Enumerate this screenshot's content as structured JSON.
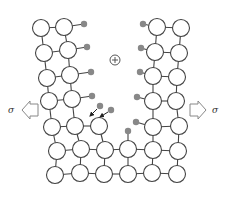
{
  "diagram": {
    "title": "",
    "labels": {
      "stress_left": "σ",
      "stress_right": "σ",
      "ion_symbol": "⊕"
    },
    "colors": {
      "atom_stroke": "#444444",
      "atom_fill": "#ffffff",
      "adatom_fill": "#888888",
      "stress_arrow_stroke": "#888888"
    },
    "atom_radius": 8.5,
    "atoms": [
      [
        41,
        28
      ],
      [
        64,
        27
      ],
      [
        44,
        53
      ],
      [
        68,
        50
      ],
      [
        47,
        78
      ],
      [
        70,
        75
      ],
      [
        49,
        101
      ],
      [
        72,
        99
      ],
      [
        52,
        127
      ],
      [
        75,
        126
      ],
      [
        99,
        126
      ],
      [
        57,
        151
      ],
      [
        81,
        149
      ],
      [
        105,
        150
      ],
      [
        128,
        149
      ],
      [
        153,
        150
      ],
      [
        178,
        151
      ],
      [
        55,
        175
      ],
      [
        80,
        173
      ],
      [
        104,
        174
      ],
      [
        128,
        174
      ],
      [
        152,
        173
      ],
      [
        177,
        174
      ],
      [
        157,
        27
      ],
      [
        181,
        28
      ],
      [
        155,
        52
      ],
      [
        179,
        53
      ],
      [
        153,
        76
      ],
      [
        177,
        77
      ],
      [
        153,
        101
      ],
      [
        176,
        101
      ],
      [
        153,
        127
      ],
      [
        179,
        126
      ]
    ],
    "bonds": [
      [
        0,
        1
      ],
      [
        2,
        3
      ],
      [
        4,
        5
      ],
      [
        6,
        7
      ],
      [
        8,
        9
      ],
      [
        9,
        10
      ],
      [
        11,
        12
      ],
      [
        12,
        13
      ],
      [
        13,
        14
      ],
      [
        14,
        15
      ],
      [
        15,
        16
      ],
      [
        17,
        18
      ],
      [
        18,
        19
      ],
      [
        19,
        20
      ],
      [
        20,
        21
      ],
      [
        21,
        22
      ],
      [
        0,
        2
      ],
      [
        1,
        3
      ],
      [
        2,
        4
      ],
      [
        3,
        5
      ],
      [
        4,
        6
      ],
      [
        5,
        7
      ],
      [
        6,
        8
      ],
      [
        7,
        9
      ],
      [
        8,
        11
      ],
      [
        9,
        12
      ],
      [
        10,
        13
      ],
      [
        11,
        17
      ],
      [
        12,
        18
      ],
      [
        13,
        19
      ],
      [
        14,
        20
      ],
      [
        15,
        21
      ],
      [
        16,
        22
      ],
      [
        23,
        24
      ],
      [
        25,
        26
      ],
      [
        27,
        28
      ],
      [
        29,
        30
      ],
      [
        31,
        32
      ],
      [
        23,
        25
      ],
      [
        24,
        26
      ],
      [
        25,
        27
      ],
      [
        26,
        28
      ],
      [
        27,
        29
      ],
      [
        28,
        30
      ],
      [
        29,
        31
      ],
      [
        30,
        32
      ],
      [
        31,
        15
      ],
      [
        32,
        16
      ]
    ],
    "adatoms": [
      {
        "x": 84,
        "y": 24,
        "bonded_to": 1
      },
      {
        "x": 87,
        "y": 47,
        "bonded_to": 3
      },
      {
        "x": 91,
        "y": 72,
        "bonded_to": 5
      },
      {
        "x": 92,
        "y": 96,
        "bonded_to": 7
      },
      {
        "x": 143,
        "y": 24,
        "bonded_to": 23
      },
      {
        "x": 141,
        "y": 48,
        "bonded_to": 25
      },
      {
        "x": 140,
        "y": 72,
        "bonded_to": 27
      },
      {
        "x": 137,
        "y": 97,
        "bonded_to": 29
      },
      {
        "x": 136,
        "y": 122,
        "bonded_to": 31
      },
      {
        "x": 128,
        "y": 131,
        "bonded_to": 14
      },
      {
        "x": 100,
        "y": 106,
        "bonded_to": null
      },
      {
        "x": 111,
        "y": 110,
        "bonded_to": null
      }
    ],
    "ion": {
      "x": 115,
      "y": 60
    },
    "attack_arrows": [
      {
        "from": [
          97,
          109
        ],
        "to": [
          90,
          116
        ]
      },
      {
        "from": [
          108,
          112
        ],
        "to": [
          100,
          117
        ]
      }
    ],
    "stress_arrows": {
      "left": {
        "tip_x": 22,
        "y": 110,
        "label_x": 10
      },
      "right": {
        "tip_x": 206,
        "y": 110,
        "label_x": 212
      }
    }
  }
}
